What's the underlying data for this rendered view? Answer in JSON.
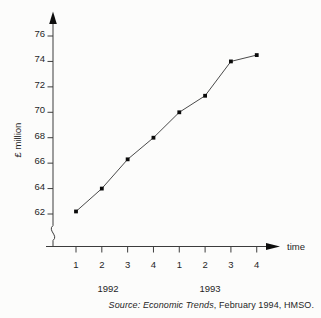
{
  "figure": {
    "caption": {
      "prefix": "Source: ",
      "source_title": "Economic Trends",
      "suffix": ", February 1994, HMSO."
    }
  },
  "chart_data": {
    "type": "line",
    "title": "",
    "ylabel": "£ million",
    "xlabel": "time",
    "categories": [
      "1992 Q1",
      "1992 Q2",
      "1992 Q3",
      "1992 Q4",
      "1993 Q1",
      "1993 Q2",
      "1993 Q3",
      "1993 Q4"
    ],
    "x_tick_labels": [
      "1",
      "2",
      "3",
      "4",
      "1",
      "2",
      "3",
      "4"
    ],
    "x_group_labels": [
      "1992",
      "1993"
    ],
    "series": [
      {
        "name": "value (£ million)",
        "values": [
          62.2,
          64.0,
          66.3,
          68.0,
          70.0,
          71.3,
          74.0,
          74.5
        ]
      }
    ],
    "y_ticks": [
      62,
      64,
      66,
      68,
      70,
      72,
      74,
      76
    ],
    "ylim": [
      62,
      76
    ],
    "axis_break_below_first_tick": true,
    "grid": false,
    "legend": "none",
    "marker": "filled-square",
    "colors": {
      "line": "#4a4a4a",
      "marker": "#0a0a0a",
      "axis": "#3c3c3c",
      "text": "#1f1f1f"
    }
  }
}
